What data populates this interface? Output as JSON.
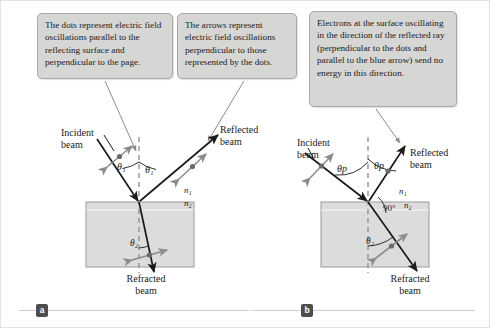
{
  "figure": {
    "width": 490,
    "height": 328,
    "background": "#ffffff",
    "border_color": "#e2e2e2"
  },
  "colors": {
    "callout_fill": "#d6d6d4",
    "callout_border": "#a9a9a6",
    "slab_fill": "#dcdcdc",
    "slab_border": "#9a9a9a",
    "ray_stroke": "#1a1a1a",
    "oscillation_arrow": "#8c8c8c",
    "normal_dash": "#8c8c8c",
    "leader_line": "#8c8c8c",
    "badge_fill": "#4d4d4d",
    "text": "#1a1a1a",
    "rule_line": "#cfcfcf"
  },
  "callouts": [
    {
      "id": "callout-dots",
      "text": "The dots represent electric field oscillations parallel to the reflecting surface and perpendicular to the page.",
      "points_to": "panel-a-incident-beam"
    },
    {
      "id": "callout-arrows",
      "text": "The arrows represent electric field oscillations perpendicular to those represented by the dots.",
      "points_to": "panel-a-reflected-beam"
    },
    {
      "id": "callout-electrons",
      "text": "Electrons at the surface oscillating in the direction of the reflected ray (perpendicular to the dots and parallel to the blue arrow) send no energy in this direction.",
      "points_to": "panel-b-reflected-beam"
    }
  ],
  "panel_a": {
    "badge": "a",
    "labels": {
      "incident_beam": "Incident\nbeam",
      "reflected_beam": "Reflected\nbeam",
      "refracted_beam": "Refracted\nbeam",
      "angle_incidence": "θ₁",
      "angle_reflection": "θ₁",
      "angle_refraction": "θ₂",
      "index_above": "n₁",
      "index_below": "n₂"
    },
    "geometry": {
      "interface_y": 201,
      "incidence_point_x": 138,
      "slab": {
        "x": 85,
        "y": 201,
        "width": 108,
        "height": 65
      },
      "incident_angle_deg": 34,
      "reflected_angle_deg": 34,
      "refracted_angle_deg": 13
    }
  },
  "panel_b": {
    "badge": "b",
    "labels": {
      "incident_beam": "Incident\nbeam",
      "reflected_beam": "Reflected\nbeam",
      "refracted_beam": "Refracted\nbeam",
      "angle_incidence": "θp",
      "angle_reflection": "θp",
      "angle_refraction": "θ₂",
      "right_angle": "90°",
      "index_above": "n₁",
      "index_below": "n₂"
    },
    "geometry": {
      "interface_y": 201,
      "incidence_point_x": 367,
      "slab": {
        "x": 320,
        "y": 201,
        "width": 108,
        "height": 65
      },
      "incidence_angle_deg": 56,
      "reflected_angle_deg": 56,
      "refracted_angle_deg": 34,
      "between_reflected_and_refracted_deg": 90
    }
  }
}
